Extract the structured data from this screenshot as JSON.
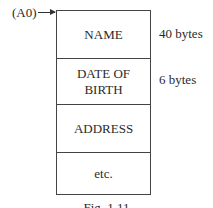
{
  "diagram": {
    "pointer": {
      "label": "(A0)"
    },
    "record_fields": [
      {
        "label": "NAME",
        "size": "40 bytes"
      },
      {
        "label": "DATE OF\nBIRTH",
        "size": "6 bytes"
      },
      {
        "label": "ADDRESS",
        "size": ""
      },
      {
        "label": "etc.",
        "size": ""
      }
    ],
    "caption": "Fig. 1.11"
  }
}
